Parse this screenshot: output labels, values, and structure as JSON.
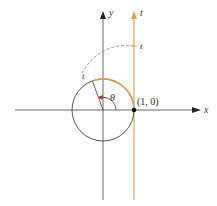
{
  "diagram": {
    "type": "unit-circle-wrapping",
    "labels": {
      "x_axis": "x",
      "y_axis": "y",
      "tangent_line": "t",
      "tangent_point_t": "t",
      "arc_point_t": "t",
      "angle": "θ",
      "point": "(1, 0)"
    },
    "colors": {
      "axes": "#555555",
      "circle": "#444444",
      "tangent_line": "#d4a060",
      "wrapped_arc": "#d4a060",
      "dashed_arc": "#888888",
      "angle_marker": "#b03040",
      "point": "#111111"
    }
  }
}
